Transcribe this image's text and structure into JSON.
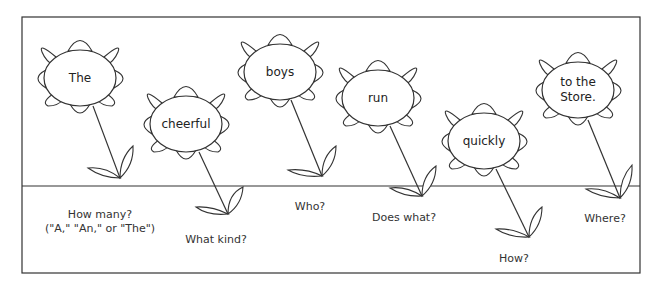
{
  "diagram": {
    "colors": {
      "line": "#333333",
      "background": "#ffffff"
    },
    "frame": {
      "x": 22,
      "y": 17,
      "width": 618,
      "height": 256
    },
    "ground_y": 186,
    "flowers": [
      {
        "word": "The",
        "cx": 80,
        "cy": 78,
        "question": "How many?",
        "question_line2": "(\"A,\" \"An,\" or \"The\")",
        "root_x": 120,
        "root_y": 178,
        "label_x": 100,
        "label_y": 221
      },
      {
        "word": "cheerful",
        "cx": 186,
        "cy": 124,
        "question": "What kind?",
        "question_line2": "",
        "root_x": 228,
        "root_y": 214,
        "label_x": 216,
        "label_y": 242
      },
      {
        "word": "boys",
        "cx": 280,
        "cy": 72,
        "question": "Who?",
        "question_line2": "",
        "root_x": 322,
        "root_y": 176,
        "label_x": 310,
        "label_y": 209
      },
      {
        "word": "run",
        "cx": 378,
        "cy": 98,
        "question": "Does what?",
        "question_line2": "",
        "root_x": 422,
        "root_y": 196,
        "label_x": 404,
        "label_y": 220
      },
      {
        "word": "quickly",
        "cx": 484,
        "cy": 141,
        "question": "How?",
        "question_line2": "",
        "root_x": 529,
        "root_y": 237,
        "label_x": 514,
        "label_y": 262
      },
      {
        "word": "to the",
        "word_line2": "Store.",
        "cx": 578,
        "cy": 90,
        "question": "Where?",
        "question_line2": "",
        "root_x": 620,
        "root_y": 198,
        "label_x": 605,
        "label_y": 221
      }
    ]
  }
}
